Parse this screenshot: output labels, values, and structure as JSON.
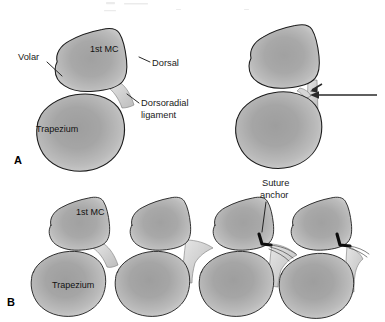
{
  "figure": {
    "kind": "anatomical-illustration",
    "background_color": "#ffffff",
    "ink_color": "#1c1c1c",
    "bone_fill_color": "#8a8a8a",
    "bone_edge_color": "#d2d2d2",
    "ligament_color": "#c9c9c9",
    "anchor_color": "#0d0d0d",
    "arrow_color": "#2a2a2a",
    "width": 385,
    "height": 322
  },
  "panels": [
    {
      "id": "A",
      "letter": "A",
      "row": "top",
      "views": [
        {
          "id": "a-left",
          "caption_role": "normal-anatomy",
          "labels": [
            {
              "key": "volar",
              "text": "Volar",
              "x": 18,
              "y": 60,
              "anchor": "start",
              "leader": true
            },
            {
              "key": "first_mc",
              "text": "1st MC",
              "x": 90,
              "y": 52,
              "anchor": "start",
              "leader": false
            },
            {
              "key": "dorsal",
              "text": "Dorsal",
              "x": 152,
              "y": 66,
              "anchor": "start",
              "leader": true
            },
            {
              "key": "trapezium",
              "text": "Trapezium",
              "x": 36,
              "y": 132,
              "anchor": "start",
              "leader": false
            },
            {
              "key": "dorsoradial_ligament_l1",
              "text": "Dorsoradial",
              "x": 141,
              "y": 106,
              "anchor": "start",
              "leader": true
            },
            {
              "key": "dorsoradial_ligament_l2",
              "text": "ligament",
              "x": 141,
              "y": 118,
              "anchor": "start",
              "leader": false
            }
          ]
        },
        {
          "id": "a-right",
          "caption_role": "ligament-disruption",
          "labels": [],
          "arrows": [
            {
              "key": "arrow-short-angled",
              "style": "short-angled"
            },
            {
              "key": "arrow-long-horizontal",
              "style": "long-horizontal"
            }
          ]
        }
      ]
    },
    {
      "id": "B",
      "letter": "B",
      "row": "bottom",
      "views": [
        {
          "id": "b-1",
          "caption_role": "normal-anatomy",
          "labels": [
            {
              "key": "first_mc",
              "text": "1st MC",
              "x": 76,
              "y": 215,
              "anchor": "start",
              "leader": false
            },
            {
              "key": "trapezium",
              "text": "Trapezium",
              "x": 52,
              "y": 288,
              "anchor": "start",
              "leader": false
            }
          ]
        },
        {
          "id": "b-2",
          "caption_role": "ligament-detached",
          "labels": []
        },
        {
          "id": "b-3",
          "caption_role": "anchor-placed",
          "labels": [
            {
              "key": "suture_anchor_l1",
              "text": "Suture",
              "x": 262,
              "y": 186,
              "anchor": "start",
              "leader": true
            },
            {
              "key": "suture_anchor_l2",
              "text": "anchor",
              "x": 260,
              "y": 198,
              "anchor": "start",
              "leader": false
            }
          ]
        },
        {
          "id": "b-4",
          "caption_role": "repair-tensioned",
          "labels": []
        }
      ]
    }
  ],
  "panel_letters": {
    "a": {
      "text": "A",
      "x": 14,
      "y": 164
    },
    "b": {
      "text": "B",
      "x": 7,
      "y": 306
    }
  }
}
